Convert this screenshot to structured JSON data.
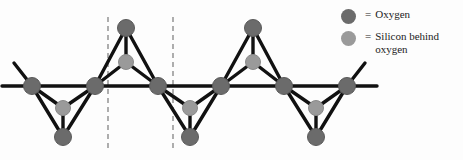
{
  "figure": {
    "background_color": "#fdfdfd"
  },
  "colors": {
    "oxygen": "#6b6b6b",
    "oxygen_stroke": "#5a5a5a",
    "silicon": "#9a9a9a",
    "silicon_stroke": "#8a8a8a",
    "bond": "#111111",
    "dashed_line": "#7a7a7a",
    "text": "#1c1c1c"
  },
  "legend": {
    "items": [
      {
        "swatch_name": "oxygen-swatch",
        "swatch_color": "#6b6b6b",
        "equals": "=",
        "label": "Oxygen"
      },
      {
        "swatch_name": "silicon-swatch",
        "swatch_color": "#9a9a9a",
        "equals": "=",
        "label": "Silicon behind oxygen"
      }
    ]
  },
  "diagram": {
    "type": "ball-and-stick-chain",
    "atom_radius": {
      "oxygen": 8.5,
      "silicon": 7.5
    },
    "bond_width": 3.4,
    "backbone_y": 86,
    "atoms": [
      {
        "id": "o-b1",
        "element": "Oxygen",
        "x": 32,
        "y": 86,
        "kind": "bridging"
      },
      {
        "id": "o-b2",
        "element": "Oxygen",
        "x": 95,
        "y": 86,
        "kind": "bridging"
      },
      {
        "id": "o-b3",
        "element": "Oxygen",
        "x": 158,
        "y": 86,
        "kind": "bridging"
      },
      {
        "id": "o-b4",
        "element": "Oxygen",
        "x": 221,
        "y": 86,
        "kind": "bridging"
      },
      {
        "id": "o-b5",
        "element": "Oxygen",
        "x": 284,
        "y": 86,
        "kind": "bridging"
      },
      {
        "id": "o-b6",
        "element": "Oxygen",
        "x": 347,
        "y": 86,
        "kind": "bridging"
      },
      {
        "id": "si-d1",
        "element": "Silicon",
        "x": 63,
        "y": 108,
        "kind": "center-down"
      },
      {
        "id": "o-d1",
        "element": "Oxygen",
        "x": 63,
        "y": 137,
        "kind": "apex-down"
      },
      {
        "id": "si-u1",
        "element": "Silicon",
        "x": 126,
        "y": 62,
        "kind": "center-up"
      },
      {
        "id": "o-u1",
        "element": "Oxygen",
        "x": 126,
        "y": 28,
        "kind": "apex-up"
      },
      {
        "id": "si-d2",
        "element": "Silicon",
        "x": 190,
        "y": 108,
        "kind": "center-down"
      },
      {
        "id": "o-d2",
        "element": "Oxygen",
        "x": 190,
        "y": 137,
        "kind": "apex-down"
      },
      {
        "id": "si-u2",
        "element": "Silicon",
        "x": 253,
        "y": 62,
        "kind": "center-up"
      },
      {
        "id": "o-u2",
        "element": "Oxygen",
        "x": 253,
        "y": 28,
        "kind": "apex-up"
      },
      {
        "id": "si-d3",
        "element": "Silicon",
        "x": 316,
        "y": 108,
        "kind": "center-down"
      },
      {
        "id": "o-d3",
        "element": "Oxygen",
        "x": 316,
        "y": 137,
        "kind": "apex-down"
      }
    ],
    "dashed_lines": [
      {
        "id": "repeat-marker-left",
        "x": 108,
        "y1": 17,
        "y2": 150
      },
      {
        "id": "repeat-marker-right",
        "x": 173,
        "y1": 17,
        "y2": 150
      }
    ],
    "open_bonds": [
      {
        "from": "o-b1",
        "to_x": 2,
        "to_y": 86
      },
      {
        "from": "o-b1",
        "to_x": 14,
        "to_y": 64
      },
      {
        "from": "o-b6",
        "to_x": 376,
        "to_y": 86
      },
      {
        "from": "o-b6",
        "to_x": 364,
        "to_y": 64
      }
    ]
  }
}
